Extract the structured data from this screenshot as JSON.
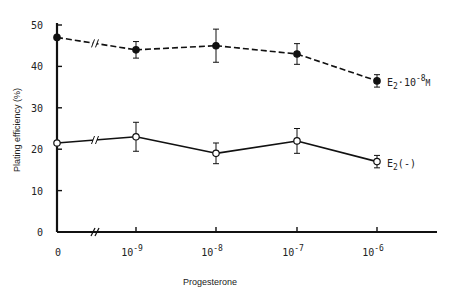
{
  "chart_data": {
    "type": "line",
    "title": "",
    "xlabel": "Progesterone",
    "ylabel": "Plating efficiency (%)",
    "ylim": [
      0,
      50
    ],
    "yticks": [
      0,
      10,
      20,
      30,
      40,
      50
    ],
    "categories": [
      "0",
      "10^-9",
      "10^-8",
      "10^-7",
      "10^-6"
    ],
    "category_labels": [
      {
        "base": "0",
        "exp": ""
      },
      {
        "base": "10",
        "exp": "-9"
      },
      {
        "base": "10",
        "exp": "-8"
      },
      {
        "base": "10",
        "exp": "-7"
      },
      {
        "base": "10",
        "exp": "-6"
      }
    ],
    "axis_break_between": [
      "0",
      "10^-9"
    ],
    "grid": false,
    "series": [
      {
        "name": "E2·10^-8M",
        "label_base": "E",
        "label_sub": "2",
        "label_rest": "·10",
        "label_exp": "-8",
        "label_tail": "M",
        "marker": "filled-circle",
        "line_style": "dashed",
        "values": [
          47,
          44,
          45,
          43,
          36.5
        ],
        "errors": [
          0,
          2,
          4,
          2.5,
          1.5
        ]
      },
      {
        "name": "E2(-)",
        "label_base": "E",
        "label_sub": "2",
        "label_rest": "(-)",
        "label_exp": "",
        "label_tail": "",
        "marker": "open-circle",
        "line_style": "solid",
        "values": [
          21.5,
          23,
          19,
          22,
          17
        ],
        "errors": [
          0,
          3.5,
          2.5,
          3,
          1.5
        ]
      }
    ],
    "colors": {
      "ink": "#111111",
      "background": "#ffffff"
    }
  }
}
